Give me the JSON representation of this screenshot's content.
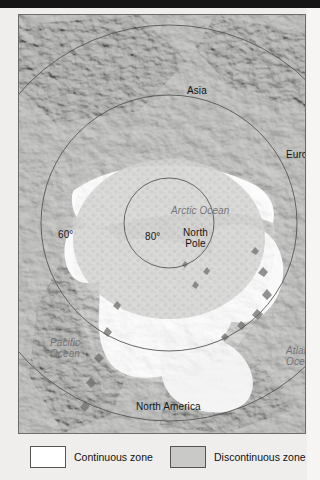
{
  "page": {
    "background_color": "#efeeec",
    "top_band_color": "#151515"
  },
  "map": {
    "projection": "polar azimuthal (North Pole centered)",
    "frame_border_color": "#6d6d6d",
    "land_color": "#b9b9b7",
    "continuous_zone_color": "#ffffff",
    "discontinuous_zone_color": "#c9c9c7",
    "graticule_color": "#585858",
    "labels": {
      "asia": "Asia",
      "europe": "Europe",
      "north_america": "North America",
      "arctic_ocean": "Arctic Ocean",
      "pacific_ocean_line1": "Pacific",
      "pacific_ocean_line2": "Ocean",
      "atlantic_ocean_line1": "Atlantic",
      "atlantic_ocean_line2": "Ocean",
      "north_pole_line1": "North",
      "north_pole_line2": "Pole",
      "latitude_60": "60°",
      "latitude_80": "80°"
    }
  },
  "legend": {
    "items": [
      {
        "label": "Continuous zone",
        "swatch_color": "#ffffff",
        "swatch_border": "#555555"
      },
      {
        "label": "Discontinuous zone",
        "swatch_color": "#c9c9c7",
        "swatch_border": "#555555"
      }
    ]
  }
}
